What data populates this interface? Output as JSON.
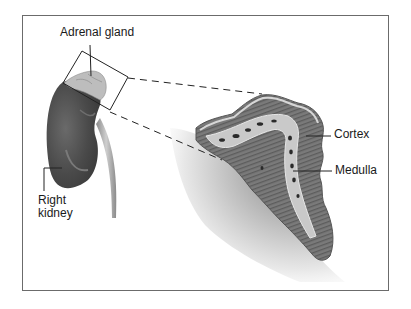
{
  "diagram": {
    "labels": {
      "adrenal_gland": "Adrenal gland",
      "right_kidney_line1": "Right",
      "right_kidney_line2": "kidney",
      "cortex": "Cortex",
      "medulla": "Medulla"
    },
    "colors": {
      "frame": "#6b6b6b",
      "kidney": "#4a4a4a",
      "adrenal": "#b8b8b8",
      "cortex_fill": "#7d7d7d",
      "cortex_edge": "#d4d4d4",
      "medulla_fill": "#c9c9c9",
      "vessel": "#2a2a2a",
      "shadow": "#9a9a9a",
      "line": "#222222"
    }
  }
}
